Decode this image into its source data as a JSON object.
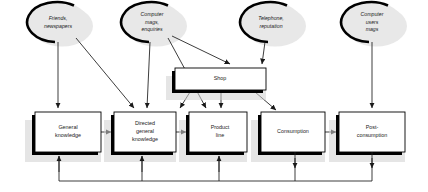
{
  "diagram": {
    "type": "flow-diagram",
    "colors": {
      "node_fill": "#ffffff",
      "node_stroke": "#000000",
      "ellipse_fill": "#e8e8e8",
      "shadow": "#000000",
      "connector": "#1a1a1a"
    },
    "sources": [
      {
        "id": "friends",
        "label_lines": [
          "Friends,",
          "newspapers"
        ],
        "cx": 58,
        "cy": 22,
        "rx": 30,
        "ry": 20
      },
      {
        "id": "computer-mags",
        "label_lines": [
          "Computer",
          "mags,",
          "enquiries"
        ],
        "cx": 152,
        "cy": 22,
        "rx": 30,
        "ry": 20
      },
      {
        "id": "telephone",
        "label_lines": [
          "Telephone,",
          "reputation"
        ],
        "cx": 271,
        "cy": 22,
        "rx": 30,
        "ry": 20
      },
      {
        "id": "computer-users-mags",
        "label_lines": [
          "Computer",
          "users",
          "mags"
        ],
        "cx": 372,
        "cy": 22,
        "rx": 30,
        "ry": 20
      }
    ],
    "stages": [
      {
        "id": "general-knowledge",
        "label_lines": [
          "General",
          "knowledge"
        ],
        "x": 35,
        "y": 112,
        "w": 66,
        "h": 40
      },
      {
        "id": "directed-general-knowledge",
        "label_lines": [
          "Directed",
          "general",
          "knowledge"
        ],
        "x": 114,
        "y": 112,
        "w": 62,
        "h": 40
      },
      {
        "id": "product-line",
        "label_lines": [
          "Product",
          "line"
        ],
        "x": 189,
        "y": 112,
        "w": 58,
        "h": 40
      },
      {
        "id": "consumption",
        "label_lines": [
          "Consumption"
        ],
        "x": 261,
        "y": 112,
        "w": 64,
        "h": 40
      },
      {
        "id": "post-consumption",
        "label_lines": [
          "Post-",
          "consumption"
        ],
        "x": 339,
        "y": 112,
        "w": 66,
        "h": 40
      },
      {
        "id": "shop",
        "label_lines": [
          "Shop"
        ],
        "x": 175,
        "y": 68,
        "w": 91,
        "h": 22
      }
    ],
    "connections": [
      {
        "from": "friends",
        "to": "general-knowledge"
      },
      {
        "from": "friends",
        "to": "directed-general-knowledge"
      },
      {
        "from": "computer-mags",
        "to": "directed-general-knowledge"
      },
      {
        "from": "computer-mags",
        "to": "product-line"
      },
      {
        "from": "computer-mags",
        "to": "shop"
      },
      {
        "from": "telephone",
        "to": "shop"
      },
      {
        "from": "computer-users-mags",
        "to": "post-consumption"
      },
      {
        "from": "general-knowledge",
        "to": "directed-general-knowledge"
      },
      {
        "from": "directed-general-knowledge",
        "to": "product-line"
      },
      {
        "from": "consumption",
        "to": "post-consumption"
      },
      {
        "from": "shop",
        "to": "product-line"
      },
      {
        "from": "shop",
        "to": "consumption"
      },
      {
        "from": "shop",
        "to": "post-consumption"
      },
      {
        "from": "consumption",
        "to": "general-knowledge",
        "via": "feedback-bus"
      },
      {
        "from": "consumption",
        "to": "directed-general-knowledge",
        "via": "feedback-bus"
      },
      {
        "from": "consumption",
        "to": "product-line",
        "via": "feedback-bus"
      },
      {
        "from": "post-consumption",
        "to": "general-knowledge",
        "via": "feedback-bus"
      },
      {
        "from": "post-consumption",
        "to": "directed-general-knowledge",
        "via": "feedback-bus"
      },
      {
        "from": "post-consumption",
        "to": "product-line",
        "via": "feedback-bus"
      }
    ],
    "feedback_bus": {
      "y": 181,
      "up_arrow_x": [
        59,
        142,
        219
      ],
      "down_arrow_x": [
        295,
        372
      ]
    }
  }
}
